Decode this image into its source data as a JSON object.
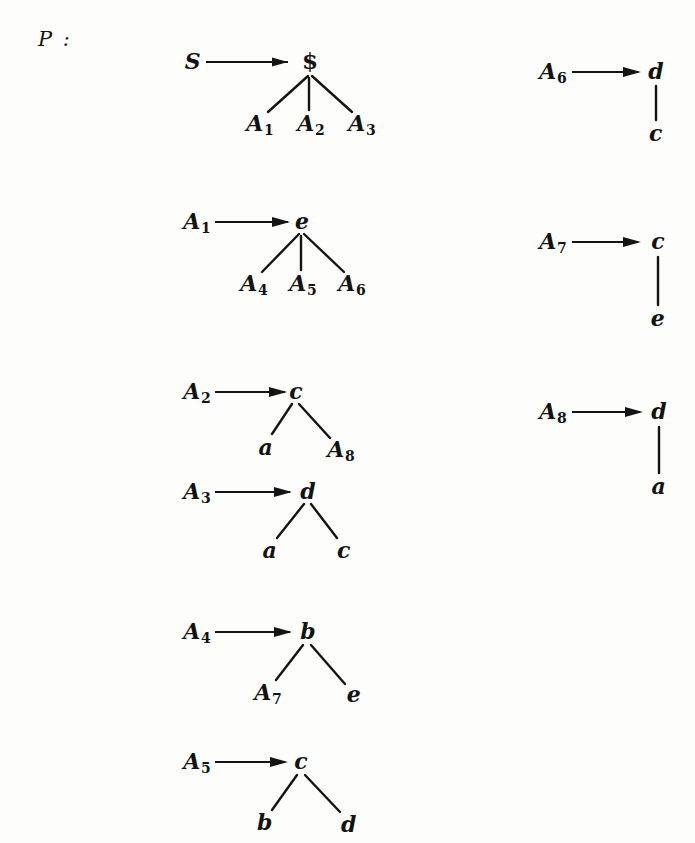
{
  "figure": {
    "set_label": "P :",
    "ink_color": "#141414",
    "background_color": "#fdfdfc"
  },
  "productions": [
    {
      "id": "rule-S",
      "lhs": "S",
      "lhs_sub": "",
      "arrow": "→",
      "root": "$",
      "root_kind": "terminal",
      "children": [
        {
          "label": "A",
          "sub": "1"
        },
        {
          "label": "A",
          "sub": "2"
        },
        {
          "label": "A",
          "sub": "3"
        }
      ]
    },
    {
      "id": "rule-A1",
      "lhs": "A",
      "lhs_sub": "1",
      "arrow": "→",
      "root": "e",
      "root_kind": "terminal",
      "children": [
        {
          "label": "A",
          "sub": "4"
        },
        {
          "label": "A",
          "sub": "5"
        },
        {
          "label": "A",
          "sub": "6"
        }
      ]
    },
    {
      "id": "rule-A2",
      "lhs": "A",
      "lhs_sub": "2",
      "arrow": "→",
      "root": "c",
      "root_kind": "terminal",
      "children": [
        {
          "label": "a",
          "sub": ""
        },
        {
          "label": "A",
          "sub": "8"
        }
      ]
    },
    {
      "id": "rule-A3",
      "lhs": "A",
      "lhs_sub": "3",
      "arrow": "→",
      "root": "d",
      "root_kind": "terminal",
      "children": [
        {
          "label": "a",
          "sub": ""
        },
        {
          "label": "c",
          "sub": ""
        }
      ]
    },
    {
      "id": "rule-A4",
      "lhs": "A",
      "lhs_sub": "4",
      "arrow": "→",
      "root": "b",
      "root_kind": "terminal",
      "children": [
        {
          "label": "A",
          "sub": "7"
        },
        {
          "label": "e",
          "sub": ""
        }
      ]
    },
    {
      "id": "rule-A5",
      "lhs": "A",
      "lhs_sub": "5",
      "arrow": "→",
      "root": "c",
      "root_kind": "terminal",
      "children": [
        {
          "label": "b",
          "sub": ""
        },
        {
          "label": "d",
          "sub": ""
        }
      ]
    },
    {
      "id": "rule-A6",
      "lhs": "A",
      "lhs_sub": "6",
      "arrow": "→",
      "root": "d",
      "root_kind": "terminal",
      "children": [
        {
          "label": "c",
          "sub": ""
        }
      ]
    },
    {
      "id": "rule-A7",
      "lhs": "A",
      "lhs_sub": "7",
      "arrow": "→",
      "root": "c",
      "root_kind": "terminal",
      "children": [
        {
          "label": "e",
          "sub": ""
        }
      ]
    },
    {
      "id": "rule-A8",
      "lhs": "A",
      "lhs_sub": "8",
      "arrow": "→",
      "root": "d",
      "root_kind": "terminal",
      "children": [
        {
          "label": "a",
          "sub": ""
        }
      ]
    }
  ]
}
